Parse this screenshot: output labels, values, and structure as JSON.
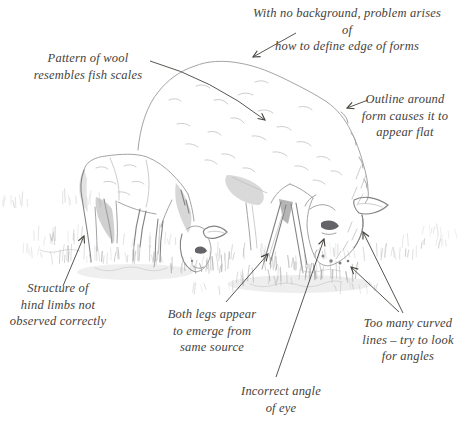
{
  "figure": {
    "kind": "annotated-pencil-sketch",
    "subjects": [
      "ewe-grazing",
      "lamb-grazing",
      "grass"
    ]
  },
  "annotations": [
    {
      "id": "background-edge",
      "text": "With no background, problem arises of\nhow to define edge of forms"
    },
    {
      "id": "wool-pattern",
      "text": "Pattern of wool\nresembles fish scales"
    },
    {
      "id": "outline-flat",
      "text": "Outline around\nform causes it to\nappear flat"
    },
    {
      "id": "hind-limbs",
      "text": "Structure of\nhind limbs not\nobserved correctly"
    },
    {
      "id": "legs-same-source",
      "text": "Both legs appear\nto emerge from\nsame source"
    },
    {
      "id": "curved-lines",
      "text": "Too many curved\nlines – try to look\nfor angles"
    },
    {
      "id": "eye-angle",
      "text": "Incorrect angle\nof eye"
    }
  ],
  "colors": {
    "ink": "#45423c",
    "pencil": "#a4a4a6",
    "pencil_dark": "#838387",
    "pencil_light": "#c7c7c9",
    "paper": "#ffffff",
    "eye": "#646468"
  }
}
